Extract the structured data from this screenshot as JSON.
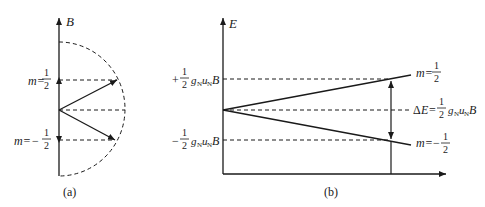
{
  "panel_a": {
    "caption": "(a)",
    "axis_label": "B",
    "levels": [
      {
        "m_prefix": "m=",
        "sign": "",
        "num": "1",
        "den": "2"
      },
      {
        "m_prefix": "m=",
        "sign": "−",
        "num": "1",
        "den": "2"
      }
    ]
  },
  "panel_b": {
    "caption": "(b)",
    "axis_label": "E",
    "left_labels": [
      {
        "sign": "+",
        "num": "1",
        "den": "2",
        "g": "g",
        "g_sub": "N",
        "u": "u",
        "u_sub": "N",
        "B": "B"
      },
      {
        "sign": "−",
        "num": "1",
        "den": "2",
        "g": "g",
        "g_sub": "N",
        "u": "u",
        "u_sub": "N",
        "B": "B"
      }
    ],
    "right_labels": {
      "upper": {
        "m_prefix": "m=",
        "sign": "",
        "num": "1",
        "den": "2"
      },
      "lower": {
        "m_prefix": "m=",
        "sign": "−",
        "num": "1",
        "den": "2"
      },
      "delta": {
        "prefix": "Δ",
        "E": "E",
        "eq": "=",
        "num": "1",
        "den": "2",
        "g": "g",
        "g_sub": "N",
        "u": "u",
        "u_sub": "N",
        "B": "B"
      }
    }
  },
  "colors": {
    "stroke": "#1a1a1a",
    "background": "#ffffff"
  }
}
